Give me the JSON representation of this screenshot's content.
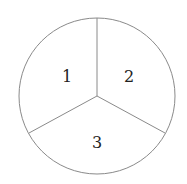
{
  "diagram": {
    "type": "spinner",
    "center": [
      97,
      96
    ],
    "radius": 78,
    "stroke_color": "#8a8a8a",
    "fill_color": "#ffffff",
    "text_color": "#222222",
    "sectors": [
      {
        "label": "1",
        "label_pos": [
          66,
          76
        ]
      },
      {
        "label": "2",
        "label_pos": [
          129,
          76
        ]
      },
      {
        "label": "3",
        "label_pos": [
          97,
          143
        ]
      }
    ],
    "dividers": [
      [
        97,
        18
      ],
      [
        29,
        133
      ],
      [
        165,
        133
      ]
    ]
  }
}
